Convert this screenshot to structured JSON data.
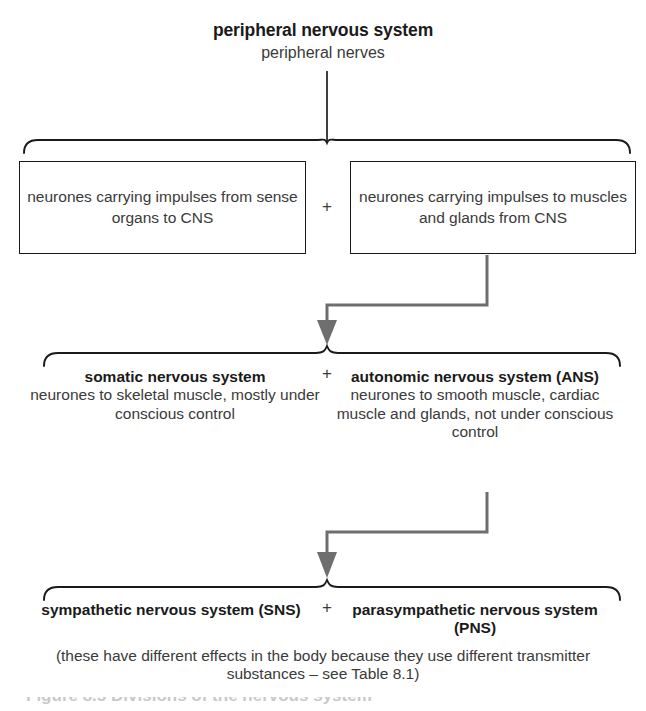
{
  "figure": {
    "heading": {
      "title": "peripheral nervous system",
      "subtitle": "peripheral nerves"
    },
    "plus_symbol": "+",
    "level1": {
      "left_box": "neurones carrying impulses from sense organs to CNS",
      "right_box": "neurones carrying impulses to muscles and glands from CNS"
    },
    "level2": {
      "left": {
        "heading": "somatic nervous system",
        "body": "neurones to skeletal muscle, mostly under conscious control"
      },
      "right": {
        "heading": "autonomic nervous system (ANS)",
        "body": "neurones to smooth muscle, cardiac muscle and glands, not under conscious control"
      }
    },
    "level3": {
      "left": {
        "heading": "sympathetic nervous system (SNS)"
      },
      "right": {
        "heading": "parasympathetic nervous system (PNS)"
      },
      "note": "(these have different effects in the body because they use different transmitter substances – see Table 8.1)"
    },
    "clipped_caption": "Figure 8.5 Divisions of the nervous system",
    "colors": {
      "ink": "#231f20",
      "bold_text": "#1a1a1a",
      "body_text": "#3a3a3a",
      "arrow": "#6e6e6e",
      "brace": "#1a1a1a",
      "background": "#ffffff"
    }
  }
}
